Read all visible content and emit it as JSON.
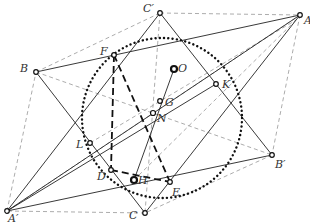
{
  "diagram": {
    "points": {
      "A": {
        "label": "A",
        "x": 300,
        "y": 15,
        "lx": 304,
        "ly": 24
      },
      "B": {
        "label": "B",
        "x": 36,
        "y": 72,
        "lx": 20,
        "ly": 72
      },
      "C": {
        "label": "C",
        "x": 145,
        "y": 213,
        "lx": 129,
        "ly": 219
      },
      "A'": {
        "label": "A′",
        "x": 7,
        "y": 211,
        "lx": 8,
        "ly": 222
      },
      "B'": {
        "label": "B′",
        "x": 272,
        "y": 155,
        "lx": 275,
        "ly": 168
      },
      "C'": {
        "label": "C′",
        "x": 160,
        "y": 13,
        "lx": 143,
        "ly": 12
      },
      "D": {
        "label": "D",
        "x": 111,
        "y": 170,
        "lx": 97,
        "ly": 180
      },
      "E": {
        "label": "E",
        "x": 170,
        "y": 182,
        "lx": 172,
        "ly": 196
      },
      "F": {
        "label": "F",
        "x": 114,
        "y": 55,
        "lx": 100,
        "ly": 55
      },
      "K": {
        "label": "K",
        "x": 216,
        "y": 84,
        "lx": 222,
        "ly": 88
      },
      "L": {
        "label": "L",
        "x": 90,
        "y": 143,
        "lx": 76,
        "ly": 148
      },
      "O": {
        "label": "O",
        "x": 174,
        "y": 69,
        "lx": 178,
        "ly": 72
      },
      "G": {
        "label": "G",
        "x": 160,
        "y": 101,
        "lx": 165,
        "ly": 106
      },
      "N": {
        "label": "N",
        "x": 153,
        "y": 113,
        "lx": 157,
        "ly": 122
      },
      "H": {
        "label": "H",
        "x": 134,
        "y": 180,
        "lx": 138,
        "ly": 184
      }
    },
    "circle": {
      "cx": 162,
      "cy": 118,
      "r": 80,
      "style": "dotted"
    },
    "colors": {
      "ink": "#111111",
      "guide": "#888888",
      "label": "#333333",
      "background": "#ffffff"
    }
  }
}
